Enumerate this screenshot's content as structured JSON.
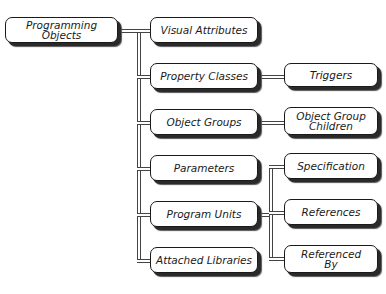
{
  "diagram": {
    "root": {
      "label": "Programming Objects"
    },
    "children": [
      {
        "label": "Visual Attributes"
      },
      {
        "label": "Property Classes"
      },
      {
        "label": "Object Groups"
      },
      {
        "label": "Parameters"
      },
      {
        "label": "Program Units"
      },
      {
        "label": "Attached Libraries"
      }
    ],
    "grandchildren": {
      "property_classes": [
        {
          "label": "Triggers"
        }
      ],
      "object_groups": [
        {
          "label_line1": "Object Group",
          "label_line2": "Children"
        }
      ],
      "program_units": [
        {
          "label": "Specification"
        },
        {
          "label": "References"
        },
        {
          "label_line1": "Referenced",
          "label_line2": "By"
        }
      ]
    }
  }
}
